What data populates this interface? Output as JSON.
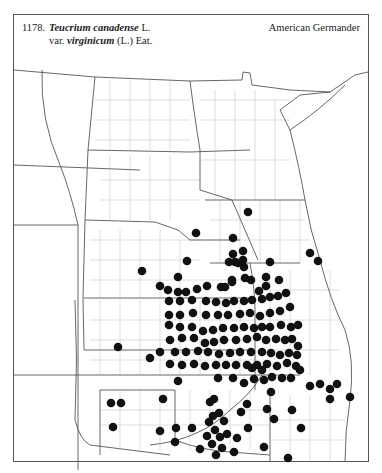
{
  "header": {
    "number": "1178.",
    "genus_species": "Teucrium canadense",
    "author1": " L.",
    "var_prefix": "var. ",
    "variety": "virginicum",
    "author2": " (L.) Eat.",
    "common_name": "American Germander"
  },
  "map": {
    "region": "Great Plains (Dakotas, Minnesota, Nebraska, Iowa, Kansas, Missouri, Oklahoma)",
    "symbol": "filled-circle",
    "symbol_color": "#111111",
    "line_color": "#555555",
    "dot_radius": 4.3,
    "dots": [
      [
        248,
        212
      ],
      [
        196,
        233
      ],
      [
        233,
        238
      ],
      [
        243,
        251
      ],
      [
        142,
        271
      ],
      [
        187,
        261
      ],
      [
        229,
        262
      ],
      [
        235,
        262
      ],
      [
        238,
        263
      ],
      [
        244,
        267
      ],
      [
        270,
        262
      ],
      [
        178,
        277
      ],
      [
        160,
        286
      ],
      [
        168,
        290
      ],
      [
        178,
        292
      ],
      [
        186,
        292
      ],
      [
        197,
        289
      ],
      [
        207,
        286
      ],
      [
        225,
        287
      ],
      [
        232,
        282
      ],
      [
        245,
        278
      ],
      [
        251,
        280
      ],
      [
        259,
        291
      ],
      [
        266,
        286
      ],
      [
        279,
        280
      ],
      [
        310,
        253
      ],
      [
        318,
        261
      ],
      [
        233,
        254
      ],
      [
        221,
        287
      ],
      [
        232,
        280
      ],
      [
        243,
        260
      ],
      [
        266,
        277
      ],
      [
        169,
        301
      ],
      [
        180,
        301
      ],
      [
        192,
        300
      ],
      [
        206,
        301
      ],
      [
        216,
        302
      ],
      [
        226,
        303
      ],
      [
        234,
        301
      ],
      [
        244,
        301
      ],
      [
        252,
        300
      ],
      [
        262,
        299
      ],
      [
        270,
        297
      ],
      [
        278,
        296
      ],
      [
        286,
        293
      ],
      [
        290,
        307
      ],
      [
        280,
        311
      ],
      [
        270,
        313
      ],
      [
        260,
        316
      ],
      [
        250,
        313
      ],
      [
        240,
        314
      ],
      [
        228,
        315
      ],
      [
        218,
        315
      ],
      [
        206,
        315
      ],
      [
        193,
        313
      ],
      [
        180,
        315
      ],
      [
        169,
        315
      ],
      [
        169,
        325
      ],
      [
        180,
        327
      ],
      [
        192,
        327
      ],
      [
        203,
        331
      ],
      [
        213,
        330
      ],
      [
        223,
        328
      ],
      [
        234,
        328
      ],
      [
        244,
        327
      ],
      [
        254,
        328
      ],
      [
        262,
        327
      ],
      [
        270,
        327
      ],
      [
        281,
        325
      ],
      [
        291,
        327
      ],
      [
        298,
        325
      ],
      [
        170,
        340
      ],
      [
        182,
        338
      ],
      [
        194,
        338
      ],
      [
        205,
        343
      ],
      [
        214,
        342
      ],
      [
        224,
        340
      ],
      [
        236,
        340
      ],
      [
        247,
        339
      ],
      [
        257,
        337
      ],
      [
        266,
        340
      ],
      [
        276,
        339
      ],
      [
        285,
        340
      ],
      [
        292,
        339
      ],
      [
        298,
        346
      ],
      [
        175,
        352
      ],
      [
        186,
        352
      ],
      [
        198,
        351
      ],
      [
        208,
        352
      ],
      [
        219,
        354
      ],
      [
        230,
        353
      ],
      [
        240,
        352
      ],
      [
        251,
        352
      ],
      [
        262,
        352
      ],
      [
        271,
        353
      ],
      [
        280,
        355
      ],
      [
        289,
        353
      ],
      [
        297,
        355
      ],
      [
        170,
        364
      ],
      [
        182,
        365
      ],
      [
        194,
        364
      ],
      [
        205,
        366
      ],
      [
        216,
        365
      ],
      [
        226,
        365
      ],
      [
        236,
        365
      ],
      [
        247,
        365
      ],
      [
        257,
        365
      ],
      [
        267,
        364
      ],
      [
        277,
        366
      ],
      [
        287,
        363
      ],
      [
        296,
        366
      ],
      [
        160,
        352
      ],
      [
        150,
        358
      ],
      [
        118,
        347
      ],
      [
        178,
        381
      ],
      [
        218,
        378
      ],
      [
        244,
        383
      ],
      [
        254,
        379
      ],
      [
        264,
        380
      ],
      [
        272,
        377
      ],
      [
        282,
        378
      ],
      [
        291,
        378
      ],
      [
        233,
        378
      ],
      [
        252,
        368
      ],
      [
        262,
        370
      ],
      [
        300,
        370
      ],
      [
        310,
        386
      ],
      [
        320,
        384
      ],
      [
        330,
        389
      ],
      [
        337,
        384
      ],
      [
        350,
        397
      ],
      [
        330,
        399
      ],
      [
        271,
        392
      ],
      [
        247,
        404
      ],
      [
        241,
        412
      ],
      [
        267,
        409
      ],
      [
        274,
        419
      ],
      [
        292,
        410
      ],
      [
        214,
        399
      ],
      [
        213,
        416
      ],
      [
        163,
        399
      ],
      [
        176,
        428
      ],
      [
        192,
        428
      ],
      [
        175,
        442
      ],
      [
        160,
        431
      ],
      [
        111,
        403
      ],
      [
        121,
        403
      ],
      [
        113,
        427
      ],
      [
        210,
        402
      ],
      [
        219,
        413
      ],
      [
        209,
        422
      ],
      [
        224,
        421
      ],
      [
        207,
        436
      ],
      [
        212,
        444
      ],
      [
        216,
        455
      ],
      [
        222,
        448
      ],
      [
        234,
        452
      ],
      [
        200,
        449
      ],
      [
        264,
        447
      ],
      [
        288,
        458
      ],
      [
        301,
        428
      ],
      [
        227,
        434
      ],
      [
        237,
        438
      ],
      [
        248,
        428
      ],
      [
        215,
        430
      ],
      [
        220,
        437
      ]
    ]
  }
}
